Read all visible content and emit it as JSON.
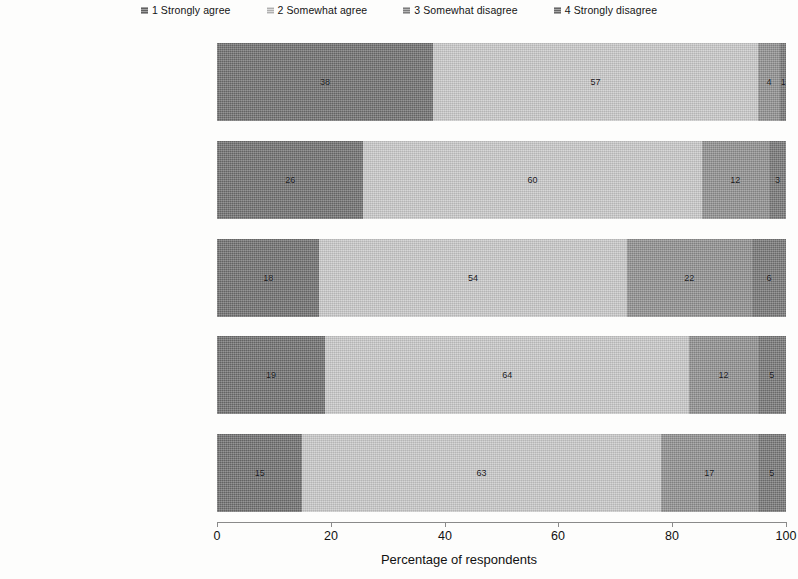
{
  "legend": {
    "items": [
      {
        "label": "1 Strongly agree",
        "color": "#6e6e6e"
      },
      {
        "label": "2 Somewhat agree",
        "color": "#c8c8c8"
      },
      {
        "label": "3 Somewhat disagree",
        "color": "#8e8e8e"
      },
      {
        "label": "4 Strongly disagree",
        "color": "#757575"
      }
    ]
  },
  "axis": {
    "title": "Percentage of respondents",
    "ticks": [
      "0",
      "20",
      "40",
      "60",
      "80",
      "100"
    ]
  },
  "chart_data": {
    "type": "bar",
    "orientation": "horizontal",
    "stacked": true,
    "title": "",
    "xlabel": "Percentage of respondents",
    "ylabel": "",
    "xlim": [
      0,
      100
    ],
    "xticks": [
      0,
      20,
      40,
      60,
      80,
      100
    ],
    "grid": false,
    "legend_position": "top",
    "categories": [
      "You should obey the directives of the police if you consider their actions lawful",
      "You should accept police decisions because that is the proper or right thing to do",
      "People like me have no choice but to obey the directives of the police",
      "When the police deal with people in my neighbourhood, they always behave according to the law",
      "The police usually act in ways that are consistent with my own ideas about what is right and wrong"
    ],
    "category_lines": [
      [
        "You should obey the directives",
        "of the police if you consider",
        "their actions lawful"
      ],
      [
        "You should accept police",
        "decisions because that is the",
        "proper or right thing to do"
      ],
      [
        "People like me have no",
        "choice but to obey the",
        "directives of the police"
      ],
      [
        "When the police deal with",
        "people in my neighbourhood,",
        "they always behave",
        "according to the law"
      ],
      [
        "The police usually act in ways",
        "that are consistent with",
        "my own ideas about what",
        "is right and wrong"
      ]
    ],
    "series": [
      {
        "name": "1 Strongly agree",
        "color": "#6e6e6e",
        "values": [
          38,
          26,
          18,
          19,
          15
        ]
      },
      {
        "name": "2 Somewhat agree",
        "color": "#c8c8c8",
        "values": [
          57,
          60,
          54,
          64,
          63
        ]
      },
      {
        "name": "3 Somewhat disagree",
        "color": "#8e8e8e",
        "values": [
          4,
          12,
          22,
          12,
          17
        ]
      },
      {
        "name": "4 Strongly disagree",
        "color": "#757575",
        "values": [
          1,
          3,
          6,
          5,
          5
        ]
      }
    ]
  }
}
